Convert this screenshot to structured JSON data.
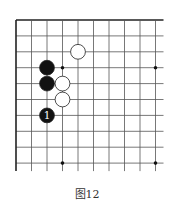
{
  "caption": "图12",
  "board": {
    "origin": {
      "x": 16,
      "y": 20
    },
    "spacing": {
      "x": 15.5,
      "y": 15.9
    },
    "cols": 10,
    "rows": 10,
    "edges": {
      "top": true,
      "left": true,
      "right": false,
      "bottom": false
    },
    "line_color": "#555555",
    "edge_color": "#222222"
  },
  "star_points": [
    {
      "col": 3,
      "row": 3
    },
    {
      "col": 9,
      "row": 3
    },
    {
      "col": 3,
      "row": 9
    },
    {
      "col": 9,
      "row": 9
    }
  ],
  "stones": [
    {
      "color": "white",
      "col": 4,
      "row": 2,
      "label": ""
    },
    {
      "color": "black",
      "col": 2,
      "row": 3,
      "label": ""
    },
    {
      "color": "black",
      "col": 2,
      "row": 4,
      "label": ""
    },
    {
      "color": "white",
      "col": 3,
      "row": 4,
      "label": ""
    },
    {
      "color": "white",
      "col": 3,
      "row": 5,
      "label": ""
    },
    {
      "color": "black",
      "col": 2,
      "row": 6,
      "label": "1"
    }
  ]
}
